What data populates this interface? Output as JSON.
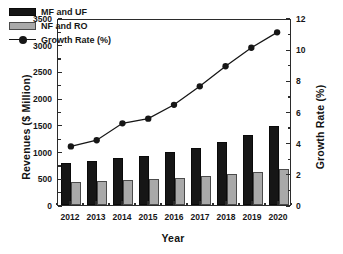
{
  "chart_data": {
    "type": "bar",
    "title": "",
    "xlabel": "Year",
    "ylabel": "Revenues ($ Million)",
    "y2label": "Growth Rate (%)",
    "categories": [
      "2012",
      "2013",
      "2014",
      "2015",
      "2016",
      "2017",
      "2018",
      "2019",
      "2020"
    ],
    "ylim": [
      0,
      3500
    ],
    "y2lim": [
      0,
      12
    ],
    "yticks": [
      0,
      500,
      1000,
      1500,
      2000,
      2500,
      3000,
      3500
    ],
    "y2ticks": [
      0,
      2,
      4,
      6,
      8,
      10,
      12
    ],
    "grid": false,
    "legend_position": "top-left",
    "series": [
      {
        "name": "MF and UF",
        "type": "bar",
        "axis": "left",
        "color": "#161616",
        "values": [
          790,
          825,
          875,
          915,
          985,
          1070,
          1180,
          1310,
          1480
        ]
      },
      {
        "name": "NF and RO",
        "type": "bar",
        "axis": "left",
        "color": "#a9a9a9",
        "values": [
          430,
          445,
          465,
          485,
          510,
          540,
          575,
          610,
          670
        ]
      },
      {
        "name": "Growth Rate (%)",
        "type": "line",
        "axis": "right",
        "color": "#161616",
        "values": [
          3.8,
          4.2,
          5.3,
          5.6,
          6.5,
          7.7,
          9.0,
          10.2,
          11.2
        ]
      }
    ]
  },
  "legend": {
    "items": [
      {
        "label": "MF and UF",
        "marker": "black-square-swatch"
      },
      {
        "label": "NF and RO",
        "marker": "gray-square-swatch"
      },
      {
        "label": "Growth Rate (%)",
        "marker": "line-circle-marker"
      }
    ]
  },
  "axes": {
    "left": {
      "title": "Revenues ($ Million)",
      "labels": [
        "0",
        "500",
        "1000",
        "1500",
        "2000",
        "2500",
        "3000",
        "3500"
      ]
    },
    "right": {
      "title": "Growth Rate (%)",
      "labels": [
        "0",
        "2",
        "4",
        "6",
        "8",
        "10",
        "12"
      ]
    },
    "bottom": {
      "title": "Year",
      "labels": [
        "2012",
        "2013",
        "2014",
        "2015",
        "2016",
        "2017",
        "2018",
        "2019",
        "2020"
      ]
    }
  }
}
